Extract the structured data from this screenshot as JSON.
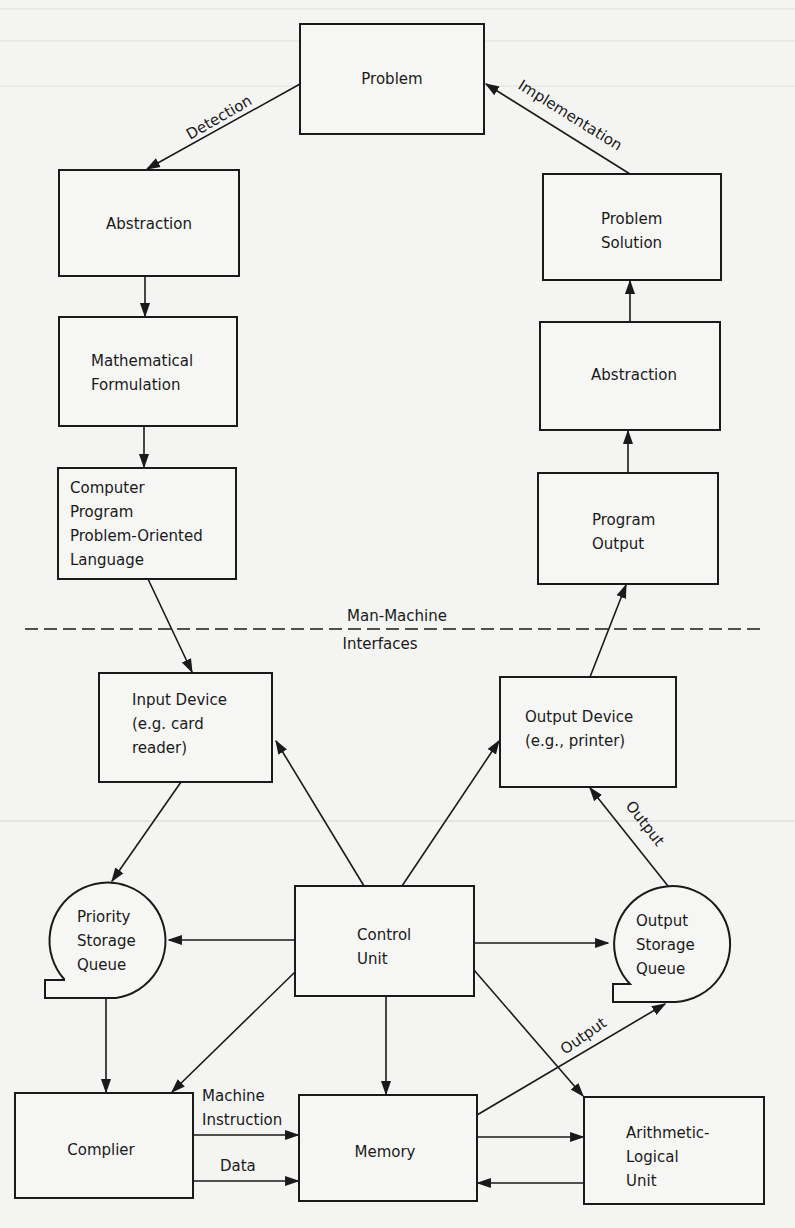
{
  "nodes": {
    "problem": {
      "lines": [
        "Problem"
      ]
    },
    "abstraction_left": {
      "lines": [
        "Abstraction"
      ]
    },
    "problem_solution": {
      "lines": [
        "Problem",
        "Solution"
      ]
    },
    "math_formulation": {
      "lines": [
        "Mathematical",
        "Formulation"
      ]
    },
    "abstraction_right": {
      "lines": [
        "Abstraction"
      ]
    },
    "computer_program": {
      "lines": [
        "Computer",
        "Program",
        "Problem-Oriented",
        "Language"
      ]
    },
    "program_output": {
      "lines": [
        "Program",
        "Output"
      ]
    },
    "input_device": {
      "lines": [
        "Input Device",
        "(e.g. card",
        "reader)"
      ]
    },
    "output_device": {
      "lines": [
        "Output Device",
        "(e.g., printer)"
      ]
    },
    "priority_queue": {
      "lines": [
        "Priority",
        "Storage",
        "Queue"
      ]
    },
    "control_unit": {
      "lines": [
        "Control",
        "Unit"
      ]
    },
    "output_queue": {
      "lines": [
        "Output",
        "Storage",
        "Queue"
      ]
    },
    "compiler": {
      "lines": [
        "Complier"
      ]
    },
    "memory": {
      "lines": [
        "Memory"
      ]
    },
    "alu": {
      "lines": [
        "Arithmetic-",
        "Logical",
        "Unit"
      ]
    }
  },
  "edge_labels": {
    "detection": "Detection",
    "implementation": "Implementation",
    "output_to_device": "Output",
    "output_from_memory": "Output",
    "machine_instruction_1": "Machine",
    "machine_instruction_2": "Instruction",
    "data": "Data"
  },
  "divider": {
    "label_top": "Man-Machine",
    "label_bottom": "Interfaces"
  }
}
